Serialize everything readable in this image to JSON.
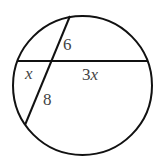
{
  "diagram": {
    "circle": {
      "cx": 82.5,
      "cy": 85.5,
      "r": 69.5
    },
    "chords": [
      {
        "name": "horizontal-chord",
        "x1": 17,
        "y1": 61,
        "x2": 148,
        "y2": 61
      },
      {
        "name": "slanted-chord",
        "x1": 70,
        "y1": 16,
        "x2": 25,
        "y2": 125
      }
    ],
    "labels": {
      "top_segment": "6",
      "left_segment": "x",
      "right_segment": "3x",
      "bottom_segment": "8"
    },
    "colors": {
      "stroke": "#111111",
      "label": "#444444"
    }
  }
}
